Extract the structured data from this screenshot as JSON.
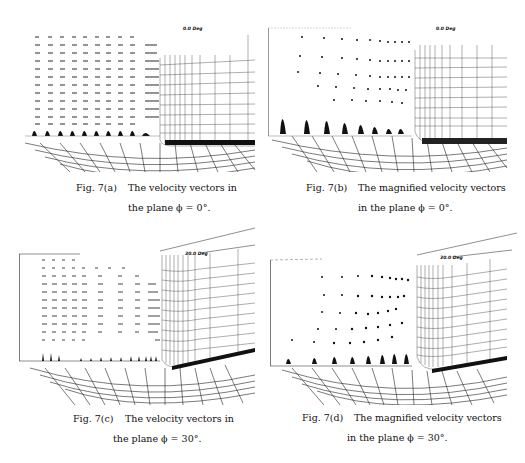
{
  "figures": [
    {
      "id": "7a",
      "label": "Fig. 7(a)",
      "caption_line1": "The velocity vectors in",
      "caption_line2": "the plane ϕ = 0°.",
      "angle_tag": "0.0 Deg"
    },
    {
      "id": "7b",
      "label": "Fig. 7(b)",
      "caption_line1": "The magnified velocity vectors",
      "caption_line2": "in the plane ϕ = 0°.",
      "angle_tag": "0.0 Deg"
    },
    {
      "id": "7c",
      "label": "Fig. 7(c)",
      "caption_line1": "The velocity vectors in",
      "caption_line2": "the plane ϕ = 30°.",
      "angle_tag": "30.0 Deg"
    },
    {
      "id": "7d",
      "label": "Fig. 7(d)",
      "caption_line1": "The magnified velocity vectors",
      "caption_line2": "in the plane ϕ = 30°.",
      "angle_tag": "30.0 Deg"
    }
  ]
}
